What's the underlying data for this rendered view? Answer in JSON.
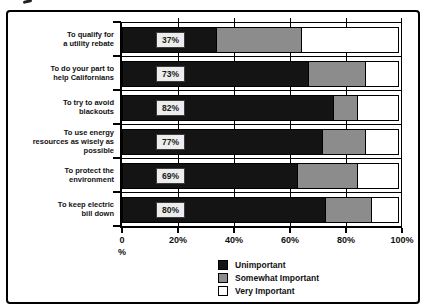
{
  "chart_data": {
    "type": "bar",
    "orientation": "horizontal",
    "stacked": true,
    "xlim": [
      0,
      100
    ],
    "x_ticks": [
      "0",
      "20%",
      "40%",
      "60%",
      "80%",
      "100%"
    ],
    "x_axis_unit_label": "%",
    "grid": true,
    "categories": [
      [
        "To qualify for",
        "a utility rebate"
      ],
      [
        "To do your part to",
        "help Californians"
      ],
      [
        "To try to avoid",
        "blackouts"
      ],
      [
        "To use energy",
        "resources as wisely as",
        "possible"
      ],
      [
        "To protect the",
        "environment"
      ],
      [
        "To keep electric",
        "bill down"
      ]
    ],
    "bar_value_labels": [
      "37%",
      "73%",
      "82%",
      "77%",
      "69%",
      "80%"
    ],
    "series": [
      {
        "name": "Unimportant",
        "color": "#141414",
        "values": [
          34,
          67,
          76,
          72,
          63,
          73
        ]
      },
      {
        "name": "Somewhat Important",
        "color": "#8c8c8c",
        "values": [
          31,
          21,
          9,
          16,
          22,
          17
        ]
      },
      {
        "name": "Very Important",
        "color": "#ffffff",
        "values": [
          35,
          12,
          15,
          12,
          15,
          10
        ]
      }
    ],
    "legend": [
      {
        "label": "Unimportant",
        "color": "#141414"
      },
      {
        "label": "Somewhat Important",
        "color": "#8c8c8c"
      },
      {
        "label": "Very Important",
        "color": "#ffffff"
      }
    ],
    "legend_position": "bottom-center"
  }
}
